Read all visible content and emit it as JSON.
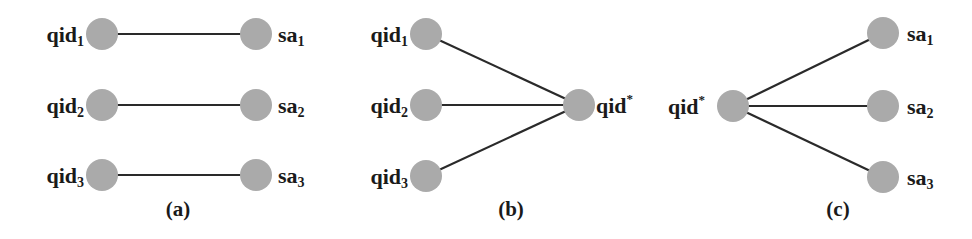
{
  "figure": {
    "colors": {
      "node": "#aaaaaa",
      "edge": "#2a2a2a",
      "text": "#1a1a1a",
      "background": "#ffffff"
    },
    "panels": [
      {
        "caption": "(a)",
        "description": "One-to-one mapping between quasi-identifiers and sensitive attributes",
        "nodes": [
          {
            "id": "qid1",
            "base": "qid",
            "sub": "1",
            "sup": ""
          },
          {
            "id": "qid2",
            "base": "qid",
            "sub": "2",
            "sup": ""
          },
          {
            "id": "qid3",
            "base": "qid",
            "sub": "3",
            "sup": ""
          },
          {
            "id": "sa1",
            "base": "sa",
            "sub": "1",
            "sup": ""
          },
          {
            "id": "sa2",
            "base": "sa",
            "sub": "2",
            "sup": ""
          },
          {
            "id": "sa3",
            "base": "sa",
            "sub": "3",
            "sup": ""
          }
        ],
        "edges": [
          [
            "qid1",
            "sa1"
          ],
          [
            "qid2",
            "sa2"
          ],
          [
            "qid3",
            "sa3"
          ]
        ]
      },
      {
        "caption": "(b)",
        "description": "Quasi-identifiers generalized to a single qid*",
        "nodes": [
          {
            "id": "qid1",
            "base": "qid",
            "sub": "1",
            "sup": ""
          },
          {
            "id": "qid2",
            "base": "qid",
            "sub": "2",
            "sup": ""
          },
          {
            "id": "qid3",
            "base": "qid",
            "sub": "3",
            "sup": ""
          },
          {
            "id": "qidstar",
            "base": "qid",
            "sub": "",
            "sup": "*"
          }
        ],
        "edges": [
          [
            "qid1",
            "qidstar"
          ],
          [
            "qid2",
            "qidstar"
          ],
          [
            "qid3",
            "qidstar"
          ]
        ]
      },
      {
        "caption": "(c)",
        "description": "Generalized qid* linked to all sensitive attributes",
        "nodes": [
          {
            "id": "qidstar",
            "base": "qid",
            "sub": "",
            "sup": "*"
          },
          {
            "id": "sa1",
            "base": "sa",
            "sub": "1",
            "sup": ""
          },
          {
            "id": "sa2",
            "base": "sa",
            "sub": "2",
            "sup": ""
          },
          {
            "id": "sa3",
            "base": "sa",
            "sub": "3",
            "sup": ""
          }
        ],
        "edges": [
          [
            "qidstar",
            "sa1"
          ],
          [
            "qidstar",
            "sa2"
          ],
          [
            "qidstar",
            "sa3"
          ]
        ]
      }
    ]
  }
}
